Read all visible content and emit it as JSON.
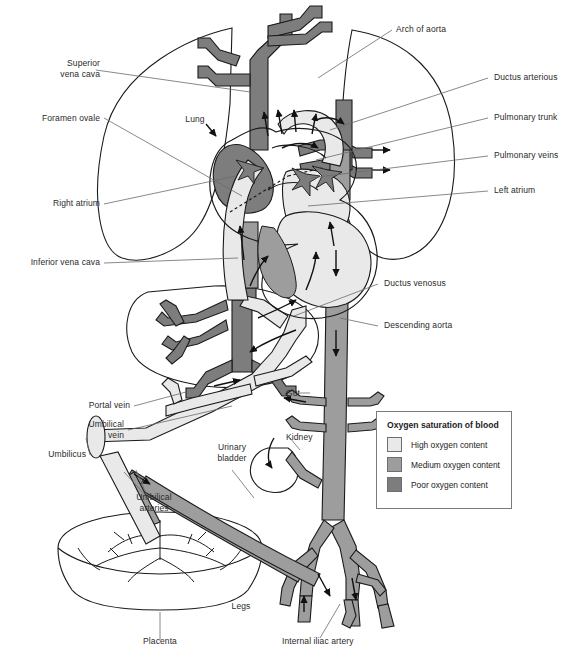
{
  "figure": {
    "bottom_caption": ""
  },
  "colors": {
    "high_oxygen": "#e9e9e9",
    "medium_oxygen": "#9d9d9d",
    "poor_oxygen": "#7d7d7d",
    "outline": "#1a1a1a",
    "leader_line": "#6b6b6b",
    "label_text": "#2a2a2a",
    "organ_fill": "#ffffff",
    "heart_mid": "#b9b9b9"
  },
  "legend": {
    "title": "Oxygen saturation of blood",
    "items": [
      {
        "label": "High oxygen content",
        "swatch": "#e9e9e9"
      },
      {
        "label": "Medium oxygen content",
        "swatch": "#9d9d9d"
      },
      {
        "label": "Poor oxygen content",
        "swatch": "#7d7d7d"
      }
    ]
  },
  "labels_left": [
    {
      "name": "superior-vena-cava",
      "text": "Superior\nvena cava"
    },
    {
      "name": "foramen-ovale",
      "text": "Foramen ovale"
    },
    {
      "name": "right-atrium",
      "text": "Right atrium"
    },
    {
      "name": "inferior-vena-cava",
      "text": "Inferior vena cava"
    },
    {
      "name": "portal-vein",
      "text": "Portal vein"
    },
    {
      "name": "umbilical-vein",
      "text": "Umbilical\nvein"
    },
    {
      "name": "umbilicus",
      "text": "Umbilicus"
    }
  ],
  "labels_right": [
    {
      "name": "arch-of-aorta",
      "text": "Arch of aorta"
    },
    {
      "name": "ductus-arteriosus",
      "text": "Ductus arterious"
    },
    {
      "name": "pulmonary-trunk",
      "text": "Pulmonary trunk"
    },
    {
      "name": "pulmonary-veins",
      "text": "Pulmonary veins"
    },
    {
      "name": "left-atrium",
      "text": "Left atrium"
    },
    {
      "name": "ductus-venosus",
      "text": "Ductus venosus"
    },
    {
      "name": "descending-aorta",
      "text": "Descending aorta"
    }
  ],
  "labels_inner": [
    {
      "name": "lung",
      "text": "Lung"
    },
    {
      "name": "gut",
      "text": "Gut"
    },
    {
      "name": "kidney",
      "text": "Kidney"
    },
    {
      "name": "urinary-bladder",
      "text": "Urinary\nbladder"
    },
    {
      "name": "umbilical-arteries",
      "text": "Umbilical\narteries"
    },
    {
      "name": "legs",
      "text": "Legs"
    },
    {
      "name": "placenta",
      "text": "Placenta"
    },
    {
      "name": "internal-iliac-artery",
      "text": "Internal iliac artery"
    }
  ]
}
